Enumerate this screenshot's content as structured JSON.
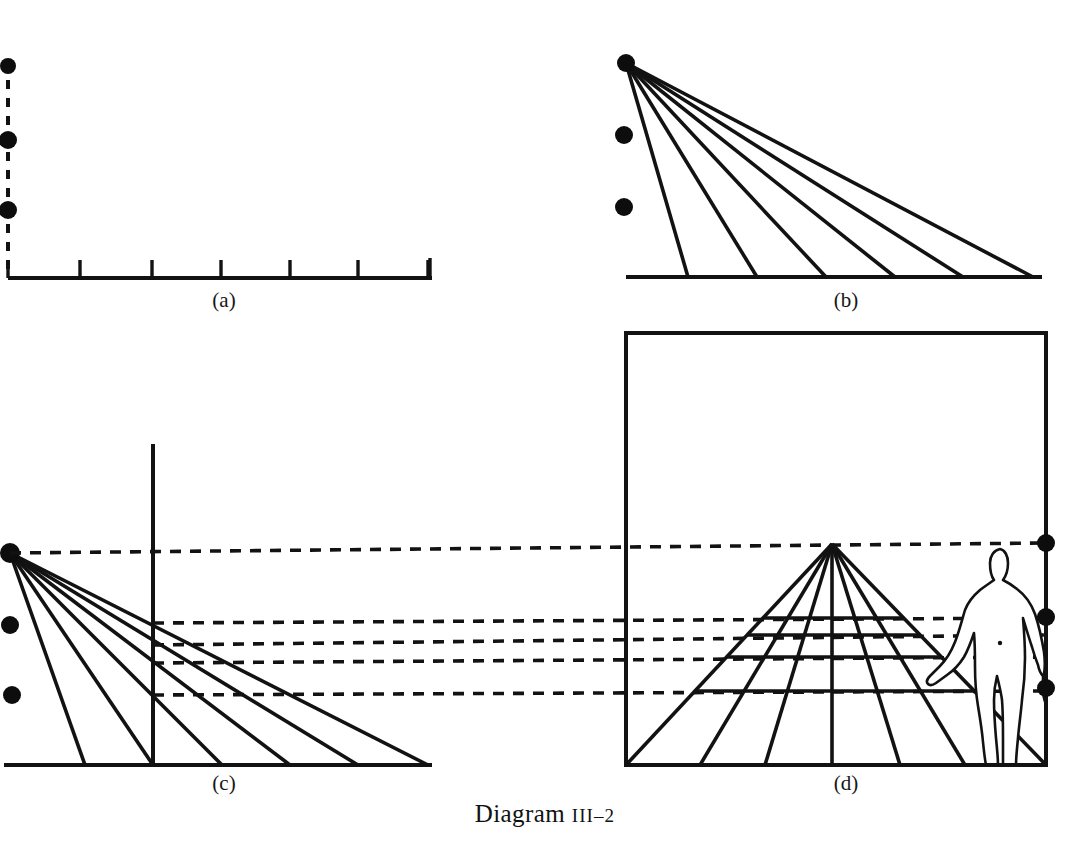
{
  "caption": {
    "prefix": "Diagram ",
    "number": "III–2",
    "full": "Diagram III–2"
  },
  "panels": [
    {
      "id": "a",
      "label": "(a)",
      "label_x": 224,
      "label_y": 307,
      "description": "Ground line with measured divisions and dashed vertical height line",
      "baseline": {
        "x1": 8,
        "y1": 278,
        "x2": 432,
        "y2": 278
      },
      "vertical_axis": {
        "x": 8,
        "y_top": 62,
        "y_bottom": 278,
        "style": "dashed"
      },
      "ticks": [
        80,
        152,
        221,
        290,
        358,
        428
      ],
      "tick_height": 18,
      "end_tick": {
        "x": 430,
        "height": 20
      },
      "dots": [
        {
          "x": 8,
          "y": 66,
          "r": 8
        },
        {
          "x": 8,
          "y": 140,
          "r": 9
        },
        {
          "x": 8,
          "y": 210,
          "r": 9
        }
      ]
    },
    {
      "id": "b",
      "label": "(b)",
      "label_x": 846,
      "label_y": 307,
      "description": "Convergence of visual rays from the eye point to the measured divisions",
      "vertex": {
        "x": 626,
        "y": 63
      },
      "baseline": {
        "x1": 626,
        "y1": 277,
        "x2": 1042,
        "y2": 277
      },
      "ray_endpoints": [
        688,
        757,
        826,
        895,
        963,
        1033
      ],
      "dots": [
        {
          "x": 624,
          "y": 135,
          "r": 9
        },
        {
          "x": 624,
          "y": 207,
          "r": 9
        }
      ]
    },
    {
      "id": "c",
      "label": "(c)",
      "label_x": 224,
      "label_y": 790,
      "description": "Picture plane inserted; intersections projected horizontally to the perspective view",
      "vertex": {
        "x": 10,
        "y": 553
      },
      "baseline": {
        "x1": 4,
        "y1": 765,
        "x2": 432,
        "y2": 765
      },
      "picture_plane": {
        "x": 153,
        "y_top": 444,
        "y_bottom": 765
      },
      "ray_endpoints": [
        85,
        153,
        222,
        290,
        358,
        428
      ],
      "dots": [
        {
          "x": 10,
          "y": 625,
          "r": 9
        },
        {
          "x": 12,
          "y": 695,
          "r": 9
        }
      ],
      "projection_lines": [
        {
          "x_start": 153,
          "y_start": 623,
          "x_end": 1046,
          "y_end": 618
        },
        {
          "x_start": 153,
          "y_start": 645,
          "x_end": 1046,
          "y_end": 635
        },
        {
          "x_start": 153,
          "y_start": 663,
          "x_end": 1046,
          "y_end": 657
        },
        {
          "x_start": 153,
          "y_start": 695,
          "x_end": 1046,
          "y_end": 691
        }
      ],
      "horizon_projection": {
        "x_start": 10,
        "y_start": 553,
        "x_end": 1046,
        "y_end": 543
      }
    },
    {
      "id": "d",
      "label": "(d)",
      "label_x": 846,
      "label_y": 790,
      "description": "Resulting one-point perspective grid with standing human figure for scale",
      "frame": {
        "x": 626,
        "y": 333,
        "width": 420,
        "height": 432
      },
      "vanishing_point": {
        "x": 832,
        "y": 544
      },
      "horizon_y": 544,
      "ground_y": 765,
      "grid_bottom_points": [
        626,
        700,
        765,
        832,
        900,
        965,
        1046
      ],
      "grid_horizontals_y": [
        618,
        635,
        657,
        691,
        765
      ],
      "dots": [
        {
          "x": 1046,
          "y": 543,
          "r": 9
        },
        {
          "x": 1046,
          "y": 617,
          "r": 9
        },
        {
          "x": 1046,
          "y": 688,
          "r": 9
        }
      ],
      "human_figure": {
        "present": true,
        "head_top_y": 545,
        "feet_y": 765,
        "center_x": 1007,
        "pose": "standing-frontal-left-arm-extended"
      }
    }
  ],
  "style": {
    "ink_color": "#121212",
    "paper_color": "#ffffff",
    "dot_color": "#0d0d0d"
  }
}
